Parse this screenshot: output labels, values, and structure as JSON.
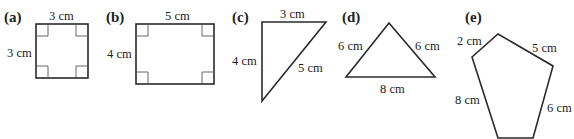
{
  "figures": [
    {
      "id": "a",
      "label": "(a)",
      "shape": "square",
      "measures": {
        "top": "3 cm",
        "left": "3 cm"
      },
      "right_angles": 4
    },
    {
      "id": "b",
      "label": "(b)",
      "shape": "rectangle",
      "measures": {
        "top": "5 cm",
        "left": "4 cm"
      },
      "right_angles": 4
    },
    {
      "id": "c",
      "label": "(c)",
      "shape": "right triangle",
      "measures": {
        "top": "3 cm",
        "left": "4 cm",
        "hypotenuse": "5 cm"
      }
    },
    {
      "id": "d",
      "label": "(d)",
      "shape": "isosceles triangle",
      "measures": {
        "left": "6 cm",
        "right": "6 cm",
        "base": "8 cm"
      }
    },
    {
      "id": "e",
      "label": "(e)",
      "shape": "pentagon",
      "measures": {
        "top_left": "2 cm",
        "top_right": "5 cm",
        "left": "8 cm",
        "right": "6 cm"
      }
    }
  ],
  "colors": {
    "stroke": "#2a2a2a",
    "text": "#222222",
    "background": "#ffffff"
  }
}
